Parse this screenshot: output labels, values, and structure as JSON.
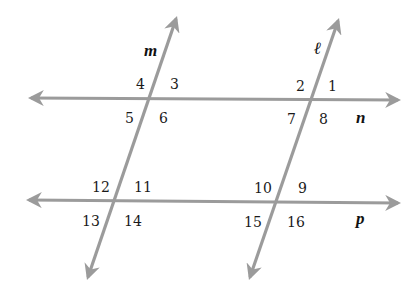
{
  "diagram": {
    "line_color": "#9b9b9b",
    "text_color": "#1a1a1a",
    "lines": [
      {
        "name": "n",
        "x1": 31,
        "y1": 98,
        "x2": 398,
        "y2": 100,
        "label": "n",
        "label_x": 356,
        "label_y": 123
      },
      {
        "name": "p",
        "x1": 29,
        "y1": 200,
        "x2": 398,
        "y2": 203,
        "label": "p",
        "label_x": 356,
        "label_y": 224
      },
      {
        "name": "m",
        "x1": 176,
        "y1": 19,
        "x2": 88,
        "y2": 277,
        "label": "m",
        "label_x": 144,
        "label_y": 56
      },
      {
        "name": "l",
        "x1": 338,
        "y1": 21,
        "x2": 250,
        "y2": 277,
        "label": "ℓ",
        "label_x": 314,
        "label_y": 54
      }
    ],
    "angles": [
      {
        "label": "1",
        "x": 328,
        "y": 91
      },
      {
        "label": "2",
        "x": 296,
        "y": 91
      },
      {
        "label": "3",
        "x": 170,
        "y": 89
      },
      {
        "label": "4",
        "x": 136,
        "y": 89
      },
      {
        "label": "5",
        "x": 125,
        "y": 123
      },
      {
        "label": "6",
        "x": 159,
        "y": 123
      },
      {
        "label": "7",
        "x": 287,
        "y": 124
      },
      {
        "label": "8",
        "x": 319,
        "y": 124
      },
      {
        "label": "9",
        "x": 298,
        "y": 193
      },
      {
        "label": "10",
        "x": 254,
        "y": 193
      },
      {
        "label": "11",
        "x": 134,
        "y": 192
      },
      {
        "label": "12",
        "x": 92,
        "y": 192
      },
      {
        "label": "13",
        "x": 82,
        "y": 226
      },
      {
        "label": "14",
        "x": 124,
        "y": 226
      },
      {
        "label": "15",
        "x": 244,
        "y": 227
      },
      {
        "label": "16",
        "x": 287,
        "y": 227
      }
    ]
  }
}
